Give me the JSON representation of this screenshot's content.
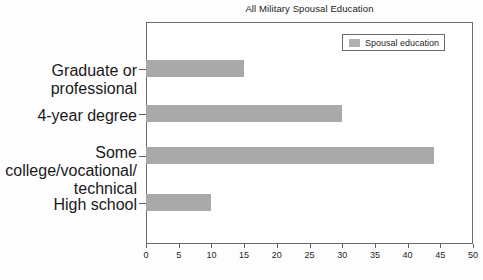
{
  "chart_data": {
    "type": "bar",
    "orientation": "horizontal",
    "title": "All Military Spousal Education",
    "xlabel": "",
    "ylabel": "",
    "categories": [
      "Graduate or professional",
      "4-year degree",
      "Some college/vocational/\ntechnical",
      "High school"
    ],
    "values": [
      15,
      30,
      44,
      10
    ],
    "series": [
      {
        "name": "Spousal education",
        "values": [
          15,
          30,
          44,
          10
        ]
      }
    ],
    "xlim": [
      0,
      50
    ],
    "xticks": [
      0,
      5,
      10,
      15,
      20,
      25,
      30,
      35,
      40,
      45,
      50
    ],
    "xtick_labels": [
      "0",
      "5",
      "10",
      "15",
      "20",
      "25",
      "30",
      "35",
      "40",
      "45",
      "50"
    ],
    "grid": false,
    "legend": {
      "position": "top-right",
      "entries": [
        {
          "label": "Spousal education",
          "color": "#a9a9a9"
        }
      ]
    },
    "colors": {
      "bar_fill": "#a9a9a9",
      "legend_swatch": "#b0b0b0",
      "frame": "#6b6b6b",
      "text": "#1f1f1f",
      "background": "#ffffff"
    }
  }
}
